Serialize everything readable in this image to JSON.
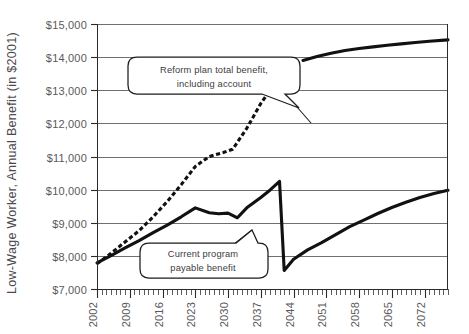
{
  "chart_data": {
    "type": "line",
    "title": "",
    "xlabel": "",
    "ylabel": "Low-Wage Worker, Annual Benefit (in $2001)",
    "xlim": [
      2002,
      2077
    ],
    "ylim": [
      7000,
      15000
    ],
    "ytick_labels": [
      "$15,000",
      "$14,000",
      "$13,000",
      "$12,000",
      "$11,000",
      "$10,000",
      "$9,000",
      "$8,000",
      "$7,000"
    ],
    "ytick_values": [
      15000,
      14000,
      13000,
      12000,
      11000,
      10000,
      9000,
      8000,
      7000
    ],
    "xtick_labels": [
      "2002",
      "2009",
      "2016",
      "2023",
      "2030",
      "2037",
      "2044",
      "2051",
      "2058",
      "2065",
      "2072"
    ],
    "xtick_values": [
      2002,
      2009,
      2016,
      2023,
      2030,
      2037,
      2044,
      2051,
      2058,
      2065,
      2072
    ],
    "grid": "horizontal",
    "legend_position": "none",
    "series": [
      {
        "name": "Reform plan total benefit, including account",
        "style": "dashed-then-solid",
        "dash_until": 2044,
        "x": [
          2002,
          2005,
          2008,
          2011,
          2014,
          2017,
          2020,
          2023,
          2026,
          2029,
          2031,
          2034,
          2037,
          2040,
          2043,
          2046,
          2049,
          2052,
          2055,
          2058,
          2061,
          2064,
          2067,
          2070,
          2073,
          2077
        ],
        "values": [
          7760,
          8080,
          8420,
          8760,
          9180,
          9640,
          10150,
          10700,
          11000,
          11120,
          11220,
          11850,
          12600,
          13200,
          13620,
          13900,
          14020,
          14120,
          14200,
          14260,
          14310,
          14360,
          14400,
          14440,
          14480,
          14520
        ]
      },
      {
        "name": "Current program payable benefit",
        "style": "solid",
        "x": [
          2002,
          2005,
          2008,
          2011,
          2014,
          2017,
          2020,
          2023,
          2026,
          2028,
          2030,
          2032,
          2034,
          2037,
          2039,
          2041,
          2042,
          2044,
          2047,
          2050,
          2053,
          2056,
          2059,
          2062,
          2065,
          2068,
          2071,
          2074,
          2077
        ],
        "values": [
          7790,
          8010,
          8240,
          8460,
          8700,
          8930,
          9180,
          9450,
          9300,
          9270,
          9290,
          9150,
          9450,
          9760,
          9990,
          10250,
          7560,
          7900,
          8180,
          8400,
          8640,
          8880,
          9080,
          9280,
          9460,
          9620,
          9760,
          9880,
          9980
        ]
      }
    ],
    "annotations": [
      {
        "name": "reform-callout",
        "line1": "Reform plan total benefit,",
        "line2": "including account",
        "points_to_year": 2032,
        "points_to_value": 12100
      },
      {
        "name": "current-callout",
        "line1": "Current program",
        "line2": "payable benefit",
        "points_to_year": 2038,
        "points_to_value": 9650
      }
    ],
    "colors": {
      "series_line": "#111111",
      "gridline": "#6f6f71",
      "axis": "#2b2b2b",
      "text": "#59595b",
      "background": "#ffffff"
    }
  }
}
